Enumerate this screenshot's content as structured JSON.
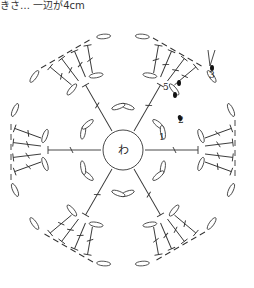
{
  "caption": "きさ… 一辺が4cm",
  "diagram": {
    "type": "crochet-hexagon-motif",
    "center_label": "わ",
    "round_labels": [
      "1",
      "2",
      "3",
      "5"
    ],
    "colors": {
      "line": "#333333",
      "background": "#ffffff",
      "slip_stitch": "#111111"
    }
  }
}
